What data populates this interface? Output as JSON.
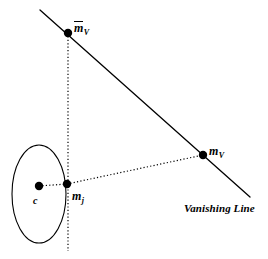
{
  "figure": {
    "type": "geometry-diagram",
    "background_color": "#ffffff",
    "stroke_color": "#000000",
    "width": 268,
    "height": 259
  },
  "labels": {
    "m_bar_V": {
      "base": "m",
      "subscript": "V",
      "overbar": true,
      "x": 74,
      "y": 21
    },
    "m_V": {
      "base": "m",
      "subscript": "V",
      "overbar": false,
      "x": 209,
      "y": 145
    },
    "m_j": {
      "base": "m",
      "subscript": "j",
      "overbar": false,
      "x": 72,
      "y": 190
    },
    "c": {
      "text": "c",
      "x": 33,
      "y": 196
    },
    "vanishing_line": {
      "text": "Vanishing Line",
      "x": 184,
      "y": 203
    }
  },
  "points": [
    {
      "name": "m-bar-v-point",
      "label": "m̄V",
      "x": 68,
      "y": 33,
      "radius": 4.2
    },
    {
      "name": "m-v-point",
      "label": "mV",
      "x": 203,
      "y": 155,
      "radius": 4.2
    },
    {
      "name": "m-j-point",
      "label": "mj",
      "x": 67,
      "y": 184,
      "radius": 4.2
    },
    {
      "name": "c-point",
      "label": "c",
      "x": 39,
      "y": 186,
      "radius": 4.2
    }
  ],
  "ellipse": {
    "name": "circle-outline",
    "cx": 39,
    "cy": 194,
    "rx": 27,
    "ry": 49,
    "stroke_width": 1.1
  },
  "lines": [
    {
      "name": "vanishing-line-segment",
      "style": "solid",
      "x1": 40,
      "y1": 10,
      "x2": 250,
      "y2": 197,
      "stroke_width": 1.3
    },
    {
      "name": "vertical-axis-dotted",
      "style": "dotted",
      "x1": 68,
      "y1": 33,
      "x2": 68,
      "y2": 251,
      "stroke_width": 1.2
    },
    {
      "name": "mj-to-mv-dotted",
      "style": "dotted",
      "x1": 67,
      "y1": 184,
      "x2": 203,
      "y2": 155,
      "stroke_width": 1.2
    },
    {
      "name": "c-to-mj-dotted",
      "style": "dotted",
      "x1": 39,
      "y1": 186,
      "x2": 67,
      "y2": 184,
      "stroke_width": 1.2
    }
  ]
}
